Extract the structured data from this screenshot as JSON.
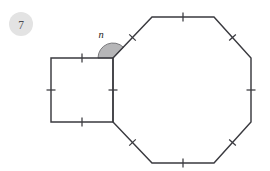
{
  "page": {
    "background_color": "#ffffff",
    "width": 270,
    "height": 171
  },
  "badge": {
    "label": "7",
    "fill_color": "#e3e3e3",
    "text_color": "#4a4a4f",
    "cx": 21,
    "cy": 24,
    "r": 12
  },
  "angle": {
    "label": "n",
    "label_x": 101,
    "label_y": 34,
    "vertex_x": 113,
    "vertex_y": 58,
    "radius": 15,
    "fill_color": "#b6b6b8",
    "stroke_color": "#6e6e72",
    "start_deg": 180,
    "end_deg": 315
  },
  "stroke": {
    "shape_color": "#3a3a3f",
    "shape_width": 1.45,
    "tick_color": "#3a3a3f",
    "tick_width": 1.25,
    "tick_length": 9
  },
  "shapes": [
    {
      "name": "square",
      "sides": 4,
      "points": "51,58 113,58 113,122 51,122",
      "closed": true
    },
    {
      "name": "octagon",
      "sides": 8,
      "points": "113,58 152,17 214,17 251,58 251,122 214,163 152,163 113,122",
      "closed": true
    }
  ],
  "edges": {
    "square": [
      {
        "name": "square-top",
        "x1": 51,
        "y1": 58,
        "x2": 113,
        "y2": 58,
        "ticks": 1
      },
      {
        "name": "square-right",
        "x1": 113,
        "y1": 58,
        "x2": 113,
        "y2": 122,
        "ticks": 1
      },
      {
        "name": "square-bottom",
        "x1": 113,
        "y1": 122,
        "x2": 51,
        "y2": 122,
        "ticks": 1
      },
      {
        "name": "square-left",
        "x1": 51,
        "y1": 122,
        "x2": 51,
        "y2": 58,
        "ticks": 1
      }
    ],
    "octagon": [
      {
        "name": "octagon-upper-left",
        "x1": 113,
        "y1": 58,
        "x2": 152,
        "y2": 17,
        "ticks": 1
      },
      {
        "name": "octagon-top",
        "x1": 152,
        "y1": 17,
        "x2": 214,
        "y2": 17,
        "ticks": 1
      },
      {
        "name": "octagon-upper-right",
        "x1": 214,
        "y1": 17,
        "x2": 251,
        "y2": 58,
        "ticks": 1
      },
      {
        "name": "octagon-right",
        "x1": 251,
        "y1": 58,
        "x2": 251,
        "y2": 122,
        "ticks": 1
      },
      {
        "name": "octagon-lower-right",
        "x1": 251,
        "y1": 122,
        "x2": 214,
        "y2": 163,
        "ticks": 1
      },
      {
        "name": "octagon-bottom",
        "x1": 214,
        "y1": 163,
        "x2": 152,
        "y2": 163,
        "ticks": 1
      },
      {
        "name": "octagon-lower-left",
        "x1": 152,
        "y1": 163,
        "x2": 113,
        "y2": 122,
        "ticks": 1
      },
      {
        "name": "octagon-left",
        "x1": 113,
        "y1": 122,
        "x2": 113,
        "y2": 58,
        "ticks": 0
      }
    ]
  }
}
